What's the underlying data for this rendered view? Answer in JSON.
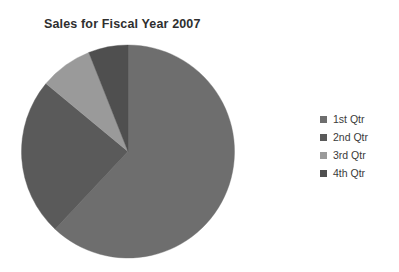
{
  "chart_data": {
    "type": "pie",
    "title": "Sales for Fiscal Year 2007",
    "xlabel": "",
    "ylabel": "",
    "categories": [
      "1st Qtr",
      "2nd Qtr",
      "3rd Qtr",
      "4th Qtr"
    ],
    "values": [
      62,
      24,
      8,
      6
    ],
    "unit": "percent",
    "start_angle_deg": 0,
    "direction": "clockwise",
    "legend_position": "right",
    "grid": false,
    "slice_colors": [
      "#6e6e6e",
      "#5a5a5a",
      "#9a9a9a",
      "#4f4f4f"
    ],
    "slices": [
      {
        "label": "1st Qtr",
        "value": 62,
        "color": "#6e6e6e",
        "start_deg": 0,
        "end_deg": 223.2
      },
      {
        "label": "2nd Qtr",
        "value": 24,
        "color": "#5a5a5a",
        "start_deg": 223.2,
        "end_deg": 309.6
      },
      {
        "label": "3rd Qtr",
        "value": 8,
        "color": "#9a9a9a",
        "start_deg": 309.6,
        "end_deg": 338.4
      },
      {
        "label": "4th Qtr",
        "value": 6,
        "color": "#4f4f4f",
        "start_deg": 338.4,
        "end_deg": 360
      }
    ]
  },
  "title": {
    "text": "Sales for Fiscal Year 2007"
  },
  "legend": {
    "items": [
      {
        "label": "1st Qtr",
        "color": "#6e6e6e"
      },
      {
        "label": "2nd Qtr",
        "color": "#5a5a5a"
      },
      {
        "label": "3rd Qtr",
        "color": "#9a9a9a"
      },
      {
        "label": "4th Qtr",
        "color": "#4f4f4f"
      }
    ]
  },
  "colors": {
    "background": "#ffffff",
    "title_text": "#2f2f2f",
    "legend_text": "#3a3a3a"
  }
}
